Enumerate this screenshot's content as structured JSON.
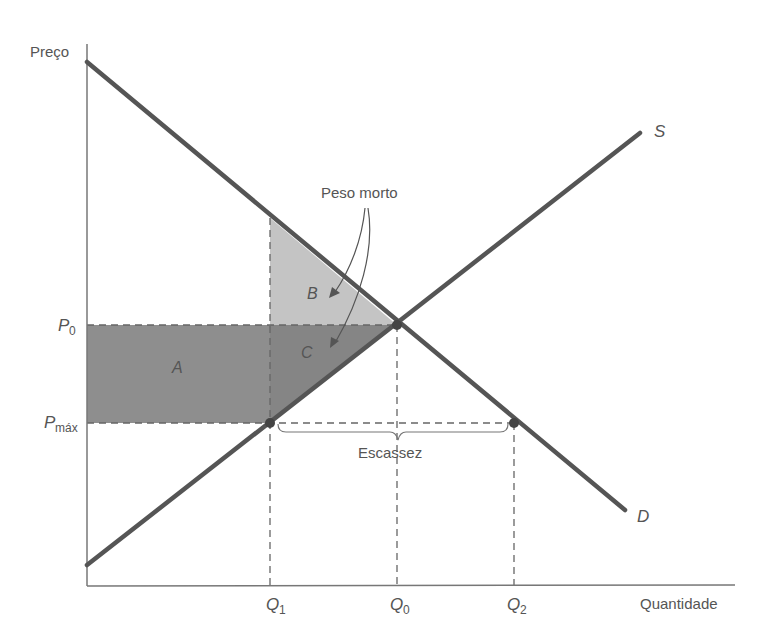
{
  "diagram": {
    "axes": {
      "y_label": "Preço",
      "x_label": "Quantidade"
    },
    "curves": {
      "supply_label": "S",
      "demand_label": "D"
    },
    "price_ticks": {
      "p0": "P",
      "p0_sub": "0",
      "pmax": "P",
      "pmax_sub": "máx"
    },
    "quantity_ticks": {
      "q1": "Q",
      "q1_sub": "1",
      "q0": "Q",
      "q0_sub": "0",
      "q2": "Q",
      "q2_sub": "2"
    },
    "areas": {
      "a": "A",
      "b": "B",
      "c": "C"
    },
    "annotations": {
      "deadweight": "Peso morto",
      "shortage": "Escassez"
    },
    "colors": {
      "curve": "#555555",
      "axis": "#777777",
      "area_a": "#8e8e8e",
      "area_b": "#c4c4c4",
      "area_c": "#8a8a8a",
      "text": "#555555"
    }
  }
}
